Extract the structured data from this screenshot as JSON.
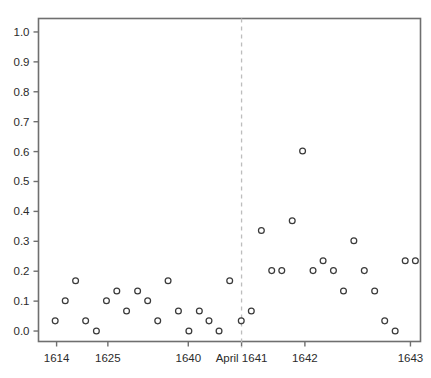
{
  "chart_data": {
    "type": "scatter",
    "title": "",
    "subtitle": "",
    "xlabel": "",
    "ylabel": "",
    "xlim": [
      0,
      38
    ],
    "ylim": [
      -0.035,
      1.045
    ],
    "grid": false,
    "legend": null,
    "legend_position": "none",
    "marker": "open-circle",
    "marker_color": "#3a3a3a",
    "yticks": [
      0.0,
      0.1,
      0.2,
      0.3,
      0.4,
      0.5,
      0.6,
      0.7,
      0.8,
      0.9,
      1.0
    ],
    "ytick_labels": [
      "0.0",
      "0.1",
      "0.2",
      "0.3",
      "0.4",
      "0.5",
      "0.6",
      "0.7",
      "0.8",
      "0.9",
      "1.0"
    ],
    "xticks": [
      1.8,
      6.9,
      14.9,
      20.2,
      26.5,
      37.0
    ],
    "xtick_labels": [
      "1614",
      "1625",
      "1640",
      "April 1641",
      "1642",
      "1643"
    ],
    "annotations": [
      {
        "name": "april-1641-divider",
        "type": "vline",
        "x": 20.2,
        "style": "dashed",
        "color": "#bdbdbd",
        "label": "April 1641"
      }
    ],
    "x": [
      1.66,
      2.66,
      3.69,
      4.69,
      5.76,
      6.76,
      7.79,
      8.76,
      9.86,
      10.86,
      11.86,
      12.89,
      13.92,
      14.96,
      16.0,
      16.96,
      17.96,
      19.02,
      20.17,
      21.17,
      22.17,
      23.2,
      24.2,
      25.24,
      26.27,
      27.31,
      28.31,
      29.34,
      30.34,
      31.37,
      32.41,
      33.44,
      34.44,
      35.48,
      36.48,
      37.49
    ],
    "y": [
      0.034,
      0.101,
      0.168,
      0.034,
      0.0,
      0.101,
      0.134,
      0.067,
      0.134,
      0.101,
      0.034,
      0.168,
      0.067,
      0.0,
      0.067,
      0.034,
      0.0,
      0.168,
      0.034,
      0.067,
      0.336,
      0.202,
      0.202,
      0.369,
      0.602,
      0.202,
      0.235,
      0.202,
      0.134,
      0.302,
      0.202,
      0.134,
      0.034,
      0.0,
      0.235,
      0.235
    ],
    "values": [
      0.034,
      0.101,
      0.168,
      0.034,
      0.0,
      0.101,
      0.134,
      0.067,
      0.134,
      0.101,
      0.034,
      0.168,
      0.067,
      0.0,
      0.067,
      0.034,
      0.0,
      0.168,
      0.034,
      0.067,
      0.336,
      0.202,
      0.202,
      0.369,
      0.602,
      0.202,
      0.235,
      0.202,
      0.134,
      0.302,
      0.202,
      0.134,
      0.034,
      0.0,
      0.235,
      0.235
    ]
  },
  "figure": {
    "background": "#ffffff",
    "axis_color": "#6f6f6f",
    "text_color": "#2b2b2b",
    "marker_stroke": "#3a3a3a",
    "divider_color": "#bdbdbd"
  }
}
